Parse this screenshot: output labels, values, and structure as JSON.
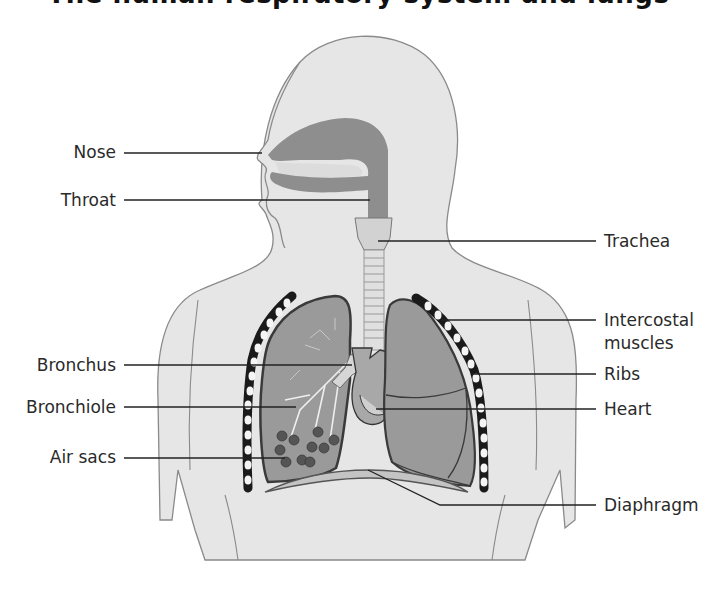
{
  "figure": {
    "title_partial": "The human respiratory system and lungs",
    "colors": {
      "background": "#ffffff",
      "body_fill": "#e6e6e6",
      "body_outline": "#8a8a8a",
      "airway_fill": "#8e8e8e",
      "lung_fill": "#9a9a9a",
      "lung_outline": "#3a3a3a",
      "rib_dark": "#1a1a1a",
      "rib_light": "#f4f4f4",
      "leader_line": "#222222",
      "label_text": "#2a2a2a"
    }
  },
  "labels": {
    "left": [
      {
        "id": "nose",
        "text": "Nose"
      },
      {
        "id": "throat",
        "text": "Throat"
      },
      {
        "id": "bronchus",
        "text": "Bronchus"
      },
      {
        "id": "bronchiole",
        "text": "Bronchiole"
      },
      {
        "id": "air_sacs",
        "text": "Air sacs"
      }
    ],
    "right": [
      {
        "id": "trachea",
        "text": "Trachea"
      },
      {
        "id": "intercostal_line1",
        "text": "Intercostal"
      },
      {
        "id": "intercostal_line2",
        "text": "muscles"
      },
      {
        "id": "ribs",
        "text": "Ribs"
      },
      {
        "id": "heart",
        "text": "Heart"
      },
      {
        "id": "diaphragm",
        "text": "Diaphragm"
      }
    ]
  }
}
